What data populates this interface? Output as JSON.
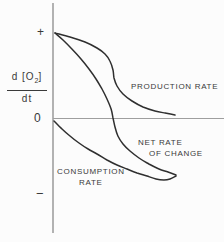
{
  "colors": {
    "background": "#fcfcfc",
    "curve": "#2f2f2f",
    "axis": "#8a8a8a",
    "zero_line": "#9e9e9e",
    "text": "#3a3a3a"
  },
  "y_axis": {
    "label": {
      "numerator_pre": "d [O",
      "numerator_sub": "2",
      "numerator_post": "]",
      "denominator": "dt"
    },
    "tick_plus": "+",
    "tick_zero": "0",
    "tick_minus": "−"
  },
  "curve_labels": {
    "production": "PRODUCTION RATE",
    "net_line1": "NET RATE",
    "net_line2": "OF CHANGE",
    "consumption_line1": "CONSUMPTION",
    "consumption_line2": "RATE"
  },
  "chart_data": {
    "type": "line",
    "title": "",
    "xlabel": "",
    "ylabel": "d[O2]/dt",
    "ytick_labels": [
      "+",
      "0",
      "−"
    ],
    "ylim": [
      -1.1,
      1.15
    ],
    "xlim": [
      0,
      1
    ],
    "grid": false,
    "legend_position": "inline-annotations",
    "series": [
      {
        "id": "production-rate",
        "name": "PRODUCTION RATE",
        "points": [
          [
            0.016,
            1.0
          ],
          [
            0.138,
            0.953
          ],
          [
            0.26,
            0.895
          ],
          [
            0.358,
            0.825
          ],
          [
            0.423,
            0.754
          ],
          [
            0.463,
            0.673
          ],
          [
            0.488,
            0.567
          ],
          [
            0.496,
            0.474
          ],
          [
            0.52,
            0.38
          ],
          [
            0.569,
            0.287
          ],
          [
            0.642,
            0.205
          ],
          [
            0.732,
            0.135
          ],
          [
            0.829,
            0.088
          ],
          [
            0.911,
            0.064
          ],
          [
            0.992,
            0.041
          ]
        ]
      },
      {
        "id": "net-rate-of-change",
        "name": "NET RATE OF CHANGE",
        "points": [
          [
            0.016,
            1.0
          ],
          [
            0.081,
            0.918
          ],
          [
            0.154,
            0.813
          ],
          [
            0.228,
            0.696
          ],
          [
            0.293,
            0.579
          ],
          [
            0.35,
            0.462
          ],
          [
            0.398,
            0.345
          ],
          [
            0.439,
            0.228
          ],
          [
            0.472,
            0.111
          ],
          [
            0.488,
            0.006
          ],
          [
            0.504,
            -0.099
          ],
          [
            0.528,
            -0.205
          ],
          [
            0.569,
            -0.298
          ],
          [
            0.626,
            -0.38
          ],
          [
            0.699,
            -0.462
          ],
          [
            0.78,
            -0.532
          ],
          [
            0.862,
            -0.591
          ],
          [
            0.935,
            -0.626
          ],
          [
            1.0,
            -0.661
          ]
        ]
      },
      {
        "id": "consumption-rate",
        "name": "CONSUMPTION RATE",
        "points": [
          [
            0.008,
            -0.029
          ],
          [
            0.073,
            -0.123
          ],
          [
            0.138,
            -0.205
          ],
          [
            0.211,
            -0.287
          ],
          [
            0.285,
            -0.357
          ],
          [
            0.358,
            -0.415
          ],
          [
            0.439,
            -0.485
          ],
          [
            0.52,
            -0.544
          ],
          [
            0.602,
            -0.591
          ],
          [
            0.683,
            -0.637
          ],
          [
            0.764,
            -0.673
          ],
          [
            0.837,
            -0.708
          ],
          [
            0.902,
            -0.719
          ],
          [
            0.951,
            -0.708
          ],
          [
            1.0,
            -0.673
          ]
        ]
      }
    ]
  }
}
